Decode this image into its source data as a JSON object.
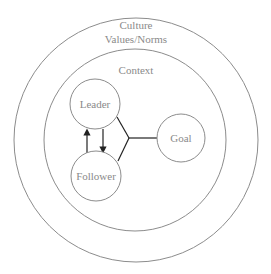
{
  "diagram": {
    "outer_ring": {
      "title": "Culture",
      "subtitle": "Values/Norms"
    },
    "inner_ring": {
      "title": "Context"
    },
    "nodes": {
      "leader": "Leader",
      "follower": "Follower",
      "goal": "Goal"
    },
    "edges": [
      {
        "from": "follower",
        "to": "leader",
        "type": "arrow"
      },
      {
        "from": "leader",
        "to": "follower",
        "type": "arrow"
      },
      {
        "from": "leader+follower",
        "to": "goal",
        "type": "merge-line"
      }
    ],
    "colors": {
      "ring_stroke": "#8c8c8c",
      "text": "#8a8a8a",
      "connector": "#222222"
    }
  }
}
